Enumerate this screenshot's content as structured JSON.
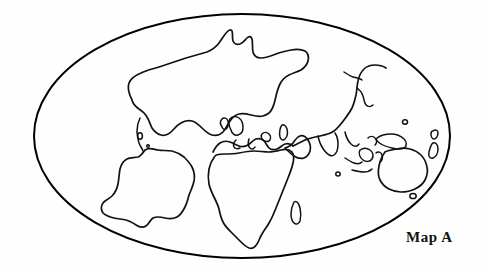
{
  "figure": {
    "title": "Map A",
    "caption": "Map A",
    "background_color": "#fefefe",
    "ink_color": "#111111"
  },
  "chart_data": {
    "type": "map",
    "title": "Map A",
    "projection": "oval (Mollweide-style) world projection",
    "style": "black and white coastline outline drawing, no fill, no graticule, no labels",
    "frame": {
      "shape": "ellipse",
      "center_x": 242,
      "center_y": 136,
      "radius_x": 208,
      "radius_y": 122,
      "stroke_color": "#000000",
      "stroke_width": 2.0
    },
    "legend": null,
    "gridlines": false,
    "axis_labels": [],
    "landmasses": [
      {
        "name": "North America",
        "approx_center": [
          160,
          95
        ]
      },
      {
        "name": "Greenland",
        "approx_center": [
          215,
          55
        ]
      },
      {
        "name": "South America",
        "approx_center": [
          140,
          185
        ]
      },
      {
        "name": "Europe",
        "approx_center": [
          245,
          130
        ]
      },
      {
        "name": "Africa",
        "approx_center": [
          255,
          195
        ]
      },
      {
        "name": "Madagascar",
        "approx_center": [
          290,
          212
        ]
      },
      {
        "name": "Asia",
        "approx_center": [
          320,
          95
        ]
      },
      {
        "name": "Arabian Peninsula",
        "approx_center": [
          300,
          155
        ]
      },
      {
        "name": "India",
        "approx_center": [
          330,
          150
        ]
      },
      {
        "name": "Japan",
        "approx_center": [
          360,
          100
        ]
      },
      {
        "name": "Indonesia",
        "approx_center": [
          360,
          165
        ]
      },
      {
        "name": "New Guinea",
        "approx_center": [
          385,
          148
        ]
      },
      {
        "name": "Australia",
        "approx_center": [
          400,
          170
        ]
      },
      {
        "name": "New Zealand",
        "approx_center": [
          432,
          160
        ]
      },
      {
        "name": "British Isles",
        "approx_center": [
          228,
          128
        ]
      }
    ]
  }
}
